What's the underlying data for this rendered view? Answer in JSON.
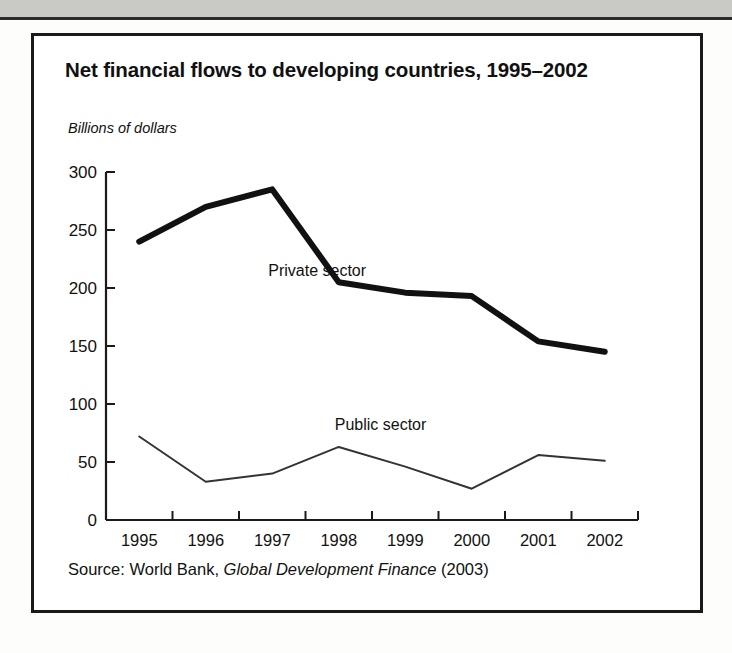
{
  "figure": {
    "title": "Net financial flows to developing countries, 1995–2002",
    "source": {
      "prefix": "Source: World Bank, ",
      "italic_title": "Global Development Finance",
      "suffix": " (2003)",
      "full": "Source: World Bank, Global Development Finance (2003)"
    }
  },
  "chart_data": {
    "type": "line",
    "title": "Net financial flows to developing countries, 1995–2002",
    "subtitle": "",
    "xlabel": "",
    "ylabel": "Billions of dollars",
    "ylim": [
      0,
      300
    ],
    "xlim": [
      "1995",
      "2002"
    ],
    "yticks": [
      0,
      50,
      100,
      150,
      200,
      250,
      300
    ],
    "ytick_labels": [
      "0",
      "50",
      "100",
      "150",
      "200",
      "250",
      "300"
    ],
    "categories": [
      "1995",
      "1996",
      "1997",
      "1998",
      "1999",
      "2000",
      "2001",
      "2002"
    ],
    "xtick_labels": [
      "1995",
      "1996",
      "1997",
      "1998",
      "1999",
      "2000",
      "2001",
      "2002"
    ],
    "grid": false,
    "legend": "inline-annotations",
    "series": [
      {
        "name": "Private sector",
        "label": "Private sector",
        "style": "thick-solid",
        "color": "#111111",
        "linewidth": 6,
        "values": [
          240,
          270,
          285,
          205,
          196,
          193,
          154,
          145
        ]
      },
      {
        "name": "Public sector",
        "label": "Public sector",
        "style": "thin-solid",
        "color": "#333333",
        "linewidth": 2,
        "values": [
          72,
          33,
          40,
          63,
          46,
          27,
          56,
          51
        ]
      }
    ],
    "annotations": [
      {
        "text": "Private sector",
        "x": "1997",
        "y": 210
      },
      {
        "text": "Public sector",
        "x": "1998",
        "y": 78
      }
    ]
  }
}
